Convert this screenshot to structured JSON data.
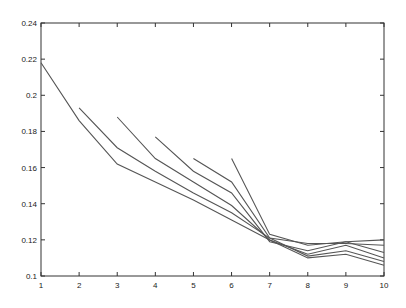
{
  "chart_data": {
    "type": "line",
    "title": "",
    "xlabel": "",
    "ylabel": "",
    "xlim": [
      1,
      10
    ],
    "ylim": [
      0.1,
      0.24
    ],
    "grid": false,
    "legend": null,
    "x_ticks": [
      "1",
      "2",
      "3",
      "4",
      "5",
      "6",
      "7",
      "8",
      "9",
      "10"
    ],
    "y_ticks": [
      "0.1",
      "0.12",
      "0.14",
      "0.16",
      "0.18",
      "0.2",
      "0.22",
      "0.24"
    ],
    "line_color": "#555555",
    "series": [
      {
        "name": "start-1",
        "x": [
          1,
          2,
          3,
          4,
          5,
          6,
          7,
          8,
          9,
          10
        ],
        "values": [
          0.218,
          0.186,
          0.162,
          0.152,
          0.142,
          0.131,
          0.12,
          0.11,
          0.112,
          0.106
        ]
      },
      {
        "name": "start-2",
        "x": [
          2,
          3,
          4,
          5,
          6,
          7,
          8,
          9,
          10
        ],
        "values": [
          0.193,
          0.171,
          0.158,
          0.146,
          0.135,
          0.121,
          0.111,
          0.114,
          0.108
        ]
      },
      {
        "name": "start-3",
        "x": [
          3,
          4,
          5,
          6,
          7,
          8,
          9,
          10
        ],
        "values": [
          0.188,
          0.165,
          0.152,
          0.139,
          0.12,
          0.112,
          0.117,
          0.11
        ]
      },
      {
        "name": "start-4",
        "x": [
          4,
          5,
          6,
          7,
          8,
          9,
          10
        ],
        "values": [
          0.177,
          0.158,
          0.146,
          0.119,
          0.114,
          0.119,
          0.113
        ]
      },
      {
        "name": "start-5",
        "x": [
          5,
          6,
          7,
          8,
          9,
          10
        ],
        "values": [
          0.165,
          0.152,
          0.121,
          0.118,
          0.118,
          0.117
        ]
      },
      {
        "name": "start-6",
        "x": [
          6,
          7,
          8,
          9,
          10
        ],
        "values": [
          0.165,
          0.123,
          0.117,
          0.119,
          0.12
        ]
      }
    ]
  }
}
